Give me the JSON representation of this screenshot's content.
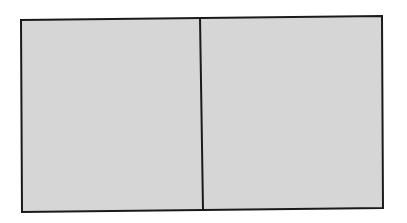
{
  "diagram": {
    "type": "rectangle-split-in-two",
    "fill_color": "#d6d6d6",
    "stroke_color": "#1a1a1a",
    "background_color": "#ffffff",
    "outer": {
      "top_left": [
        21,
        20
      ],
      "top_right": [
        382,
        16
      ],
      "bottom_right": [
        383,
        208
      ],
      "bottom_left": [
        22,
        212
      ]
    },
    "divider": {
      "top": [
        200,
        18
      ],
      "bottom": [
        203,
        210
      ]
    },
    "panels": [
      {
        "name": "left-panel",
        "label": ""
      },
      {
        "name": "right-panel",
        "label": ""
      }
    ]
  }
}
